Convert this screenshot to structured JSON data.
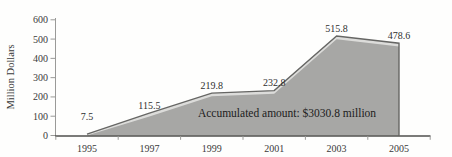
{
  "chart_data": {
    "type": "area",
    "title": "",
    "ylabel": "Million Dollars",
    "xlabel": "",
    "categories": [
      "1995",
      "1997",
      "1999",
      "2001",
      "2003",
      "2005"
    ],
    "values": [
      7.5,
      115.5,
      219.8,
      232.8,
      515.8,
      478.6
    ],
    "point_labels": [
      "7.5",
      "115.5",
      "219.8",
      "232.8",
      "515.8",
      "478.6"
    ],
    "yticks": [
      0,
      100,
      200,
      300,
      400,
      500,
      600
    ],
    "ytick_labels": [
      "0",
      "100",
      "200",
      "300",
      "400",
      "500",
      "600"
    ],
    "ylim": [
      0,
      600
    ],
    "annotation": "Accumulated amount: $3030.8 million",
    "grid": "off",
    "legend": "none",
    "layout_hints": {
      "label_dy": [
        -10,
        0,
        0,
        0,
        0,
        0
      ],
      "x_ticks_between_categories": true
    },
    "colors": {
      "area_fill": "#a7a7a5",
      "area_highlight_band": "#dcdcda",
      "series_line": "#666664",
      "x_axis": "#4f4f4d",
      "y_axis": "#9a9a98",
      "tick": "#9a9a98",
      "text": "#3a3a3a",
      "annotation_text": "#1c1c1c",
      "background": "#fefefd"
    }
  }
}
